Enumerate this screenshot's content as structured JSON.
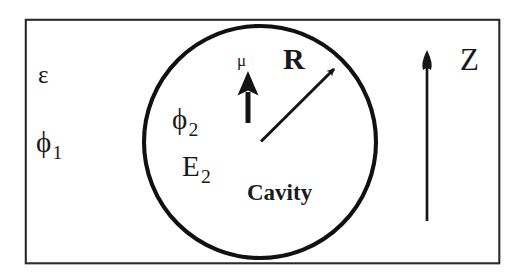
{
  "figure": {
    "colors": {
      "ink": "#1a1a1a",
      "background": "#ffffff",
      "boundary": "#2b2b2b",
      "circle": "#111111"
    },
    "outer_region": {
      "permittivity_label": "ε",
      "potential_label": "ϕ",
      "potential_subscript": "1"
    },
    "cavity": {
      "name_label": "Cavity",
      "potential_label": "ϕ",
      "potential_subscript": "2",
      "field_label": "E",
      "field_subscript": "2",
      "radius_label": "R"
    },
    "dipole": {
      "moment_label": "μ"
    },
    "axis": {
      "label": "Z"
    },
    "geometry": {
      "box": {
        "x": 25,
        "y": 19,
        "width": 475,
        "height": 245
      },
      "circle": {
        "cx": 260,
        "cy": 142,
        "r": 116
      },
      "radius_arrow": {
        "x1": 261,
        "y1": 141,
        "x2": 337,
        "y2": 66
      },
      "dipole_arrow": {
        "x": 248,
        "y_tail": 122,
        "y_head": 75
      },
      "z_arrow": {
        "x": 427,
        "y_tail": 220,
        "y_head": 52
      }
    }
  }
}
